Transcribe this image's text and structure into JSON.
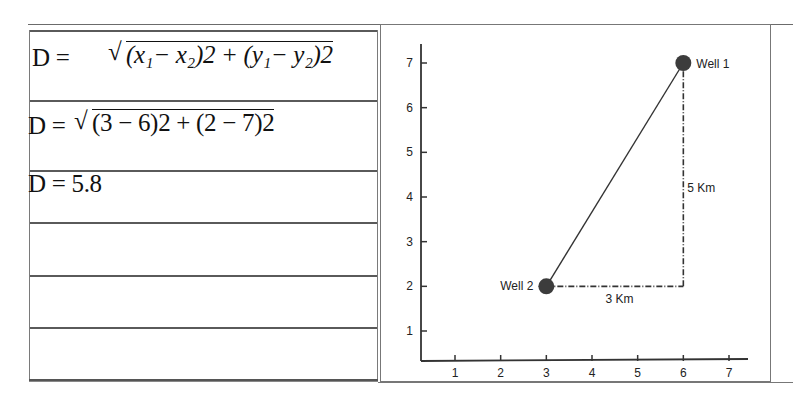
{
  "table": {
    "rows": [
      {
        "label": "D =",
        "formula": "√((x₁ − x₂)2 + (y₁ − y₂)2)",
        "lhs": "D =",
        "radicand": "(x₁− x₂)2 + (y₁− y₂)2"
      },
      {
        "label": "D =",
        "formula": "√((3 − 6)2 + (2 − 7)2)",
        "lhs": "D =",
        "radicand": "(3 − 6)2 + (2 − 7)2"
      },
      {
        "label": "D = 5.8",
        "lhs": "D = 5.8"
      },
      {
        "label": ""
      },
      {
        "label": ""
      },
      {
        "label": ""
      }
    ]
  },
  "chart_data": {
    "type": "scatter",
    "title": "",
    "xlabel": "",
    "ylabel": "",
    "x_ticks": [
      "1",
      "2",
      "3",
      "4",
      "5",
      "6",
      "7"
    ],
    "y_ticks": [
      "1",
      "2",
      "3",
      "4",
      "5",
      "6",
      "7"
    ],
    "xlim": [
      0.3,
      7.4
    ],
    "ylim": [
      0.4,
      7.4
    ],
    "grid": false,
    "points": [
      {
        "name": "Well 1",
        "x": 6,
        "y": 7
      },
      {
        "name": "Well 2",
        "x": 3,
        "y": 2
      }
    ],
    "segments": [
      {
        "from": [
          3,
          2
        ],
        "to": [
          6,
          7
        ],
        "style": "solid",
        "label": ""
      },
      {
        "from": [
          3,
          2
        ],
        "to": [
          6,
          2
        ],
        "style": "dash-dot",
        "label": "3 Km"
      },
      {
        "from": [
          6,
          2
        ],
        "to": [
          6,
          7
        ],
        "style": "dash-dot",
        "label": "5 Km"
      }
    ],
    "labels": {
      "well1": "Well 1",
      "well2": "Well 2",
      "horizontal": "3 Km",
      "vertical": "5 Km"
    }
  }
}
